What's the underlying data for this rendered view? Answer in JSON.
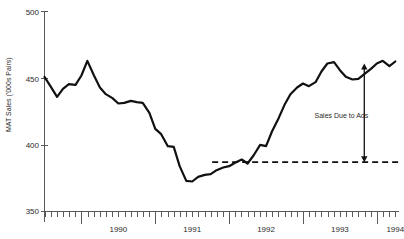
{
  "chart_data": {
    "type": "line",
    "title": "",
    "xlabel": "",
    "ylabel": "MAT Sales ('000s Pairs)",
    "ylim": [
      350,
      500
    ],
    "ytick_labels": [
      "500",
      "450",
      "400",
      "350"
    ],
    "ytick_values": [
      500,
      450,
      400,
      350
    ],
    "xtick_labels": [
      "1990",
      "1991",
      "1992",
      "1993",
      "1994"
    ],
    "xtick_values": [
      1990,
      1991,
      1992,
      1993,
      1994
    ],
    "x_minor_ticks_per_year": 12,
    "x_range": [
      1989.5,
      1994.3
    ],
    "grid": false,
    "legend": "none",
    "series": [
      {
        "name": "MAT Sales",
        "x": [
          1989.5,
          1989.58,
          1989.67,
          1989.75,
          1989.83,
          1989.92,
          1990.0,
          1990.08,
          1990.17,
          1990.25,
          1990.33,
          1990.42,
          1990.5,
          1990.58,
          1990.67,
          1990.75,
          1990.83,
          1990.92,
          1991.0,
          1991.08,
          1991.17,
          1991.25,
          1991.33,
          1991.42,
          1991.5,
          1991.58,
          1991.67,
          1991.75,
          1991.83,
          1991.92,
          1992.0,
          1992.08,
          1992.17,
          1992.25,
          1992.33,
          1992.42,
          1992.5,
          1992.58,
          1992.67,
          1992.75,
          1992.83,
          1992.92,
          1993.0,
          1993.08,
          1993.17,
          1993.25,
          1993.33,
          1993.42,
          1993.5,
          1993.58,
          1993.67,
          1993.75,
          1993.83,
          1993.92,
          1994.0,
          1994.08,
          1994.17,
          1994.25
        ],
        "y": [
          451.0,
          444.0,
          436.0,
          442.0,
          445.5,
          445.0,
          452.0,
          463.0,
          452.0,
          443.0,
          438.0,
          435.0,
          431.0,
          431.5,
          433.0,
          432.0,
          431.5,
          424.0,
          412.0,
          408.0,
          399.0,
          398.5,
          384.0,
          373.0,
          372.5,
          376.0,
          377.5,
          378.0,
          381.0,
          383.0,
          384.0,
          386.5,
          389.0,
          386.0,
          392.0,
          400.0,
          399.0,
          410.0,
          420.0,
          430.0,
          438.0,
          443.0,
          446.0,
          444.0,
          447.0,
          455.0,
          461.0,
          462.0,
          456.0,
          451.0,
          449.0,
          449.5,
          453.0,
          457.0,
          461.0,
          463.0,
          459.0,
          462.5
        ]
      }
    ],
    "reference_line": {
      "name": "Baseline Sales",
      "value": 387,
      "style": "dashed",
      "x_start": 1991.77,
      "x_end": 1994.3
    },
    "annotations": [
      {
        "text": "Sales Due to Ads",
        "x": 1993.52,
        "y": 420,
        "arrow": {
          "type": "double-headed-vertical",
          "x": 1993.83,
          "y_top": 461,
          "y_bottom": 387
        }
      }
    ]
  }
}
